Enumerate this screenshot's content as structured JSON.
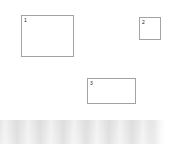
{
  "canvas": {
    "background_color": "#ffffff",
    "width": 174,
    "height": 144
  },
  "regions": [
    {
      "label": "1",
      "name": "region-box-1",
      "border_color": "#a3a3a3",
      "fill_color": "#ffffff",
      "x": 21,
      "y": 15,
      "width": 53,
      "height": 42
    },
    {
      "label": "2",
      "name": "region-box-2",
      "border_color": "#a3a3a3",
      "fill_color": "#ffffff",
      "x": 139,
      "y": 17,
      "width": 22,
      "height": 23
    },
    {
      "label": "3",
      "name": "region-box-3",
      "border_color": "#a3a3a3",
      "fill_color": "#ffffff",
      "x": 87,
      "y": 78,
      "width": 49,
      "height": 26
    }
  ],
  "bottom_band": {
    "name": "bottom-gray-band",
    "color": "#e9e9e9",
    "x": 0,
    "y": 120,
    "width": 165,
    "height": 24
  }
}
